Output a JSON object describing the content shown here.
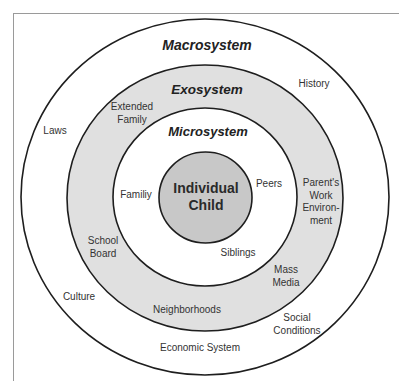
{
  "diagram": {
    "type": "concentric-circles",
    "colors": {
      "background": "#ffffff",
      "macrosystem_fill": "#ffffff",
      "exosystem_fill": "#e0e0e0",
      "microsystem_fill": "#ffffff",
      "center_fill": "#c8c8c8",
      "stroke": "#1e1e1e"
    },
    "layers": {
      "macrosystem": {
        "title": "Macrosystem",
        "items": [
          "History",
          "Laws",
          "Culture",
          "Social Conditions",
          "Economic System"
        ]
      },
      "exosystem": {
        "title": "Exosystem",
        "items": [
          "Extended Family",
          "Parent's Work Environment",
          "School Board",
          "Mass Media",
          "Neighborhoods"
        ]
      },
      "microsystem": {
        "title": "Microsystem",
        "items": [
          "Familiy",
          "Peers",
          "Siblings"
        ]
      },
      "center": {
        "line1": "Individual",
        "line2": "Child"
      }
    },
    "labels": {
      "history": "History",
      "laws": "Laws",
      "culture": "Culture",
      "social_line1": "Social",
      "social_line2": "Conditions",
      "economic": "Economic System",
      "extended_line1": "Extended",
      "extended_line2": "Family",
      "parents_line1": "Parent's",
      "parents_line2": "Work",
      "parents_line3": "Environ-",
      "parents_line4": "ment",
      "school_line1": "School",
      "school_line2": "Board",
      "mass_line1": "Mass",
      "mass_line2": "Media",
      "neighborhoods": "Neighborhoods",
      "family": "Familiy",
      "peers": "Peers",
      "siblings": "Siblings"
    }
  }
}
